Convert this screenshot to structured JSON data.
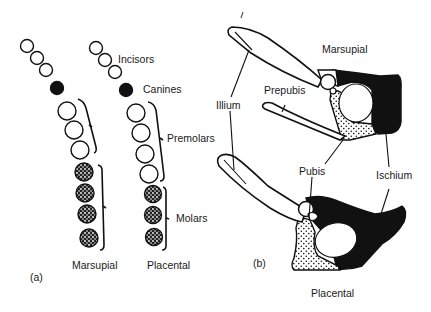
{
  "panel_a": {
    "tag": "(a)",
    "labels": {
      "incisors": "Incisors",
      "canines": "Canines",
      "premolars": "Premolars",
      "molars": "Molars"
    },
    "columns": [
      {
        "name": "Marsupial",
        "incisors": 3,
        "canines": 1,
        "premolars": 3,
        "molars": 4
      },
      {
        "name": "Placental",
        "incisors": 3,
        "canines": 1,
        "premolars": 4,
        "molars": 3
      }
    ]
  },
  "panel_b": {
    "tag": "(b)",
    "titles": {
      "top": "Marsupial",
      "bottom": "Placental"
    },
    "labels": {
      "ilium": "Illium",
      "prepubis": "Prepubis",
      "pubis": "Pubis",
      "ischium": "Ischium"
    }
  },
  "colors": {
    "ink": "#111111",
    "paper": "#ffffff"
  }
}
